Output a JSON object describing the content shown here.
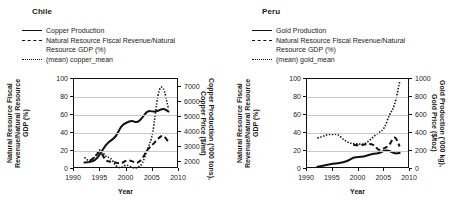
{
  "figure": {
    "panels": [
      {
        "id": "chile",
        "title": "Chile",
        "legend": [
          {
            "style": "solid",
            "label": "Copper Production"
          },
          {
            "style": "dashed",
            "label": "Natural Resource Fiscal Revenue/Natural\nResource GDP (%)"
          },
          {
            "style": "dotted",
            "label": "(mean) copper_mean"
          }
        ],
        "ylabel_left": "Natural Resource Fiscal\nRevenue/Natural Resource\nGDP (%)",
        "ylabel_right": "Copper Production ('000 tons),\nCopper Price ($/mt)",
        "xlabel": "Year",
        "yticks_left": [
          "0",
          "20",
          "40",
          "60",
          "80",
          "100"
        ],
        "yticks_right": [
          "2000",
          "3000",
          "4000",
          "5000",
          "6000",
          "7000"
        ],
        "xticks": [
          "1990",
          "1995",
          "2000",
          "2005",
          "2010"
        ]
      },
      {
        "id": "peru",
        "title": "Peru",
        "legend": [
          {
            "style": "solid",
            "label": "Gold Production"
          },
          {
            "style": "dashed",
            "label": "Natural Resource Fiscal Revenue/Natural\nResource GDP (%)"
          },
          {
            "style": "dotted",
            "label": "(mean) gold_mean"
          }
        ],
        "ylabel_left": "Natural Resource Fiscal\nRevenue/Natural Resource\nGDP (%)",
        "ylabel_right": "Gold Production ('000 kg),\nGold Price ($/toz)",
        "xlabel": "Year",
        "yticks_left": [
          "0",
          "20",
          "40",
          "60",
          "80",
          "100"
        ],
        "yticks_right": [
          "0",
          "200",
          "400",
          "600",
          "800",
          "1000"
        ],
        "xticks": [
          "1990",
          "1995",
          "2000",
          "2005",
          "2010"
        ]
      }
    ]
  },
  "chart_data": [
    {
      "type": "line",
      "id": "chile",
      "title": "Chile",
      "xlabel": "Year",
      "ylabel": "Natural Resource Fiscal Revenue/Natural Resource GDP (%)",
      "ylabel_secondary": "Copper Production ('000 tons), Copper Price ($/mt)",
      "xlim": [
        1990,
        2010
      ],
      "ylim": [
        0,
        100
      ],
      "ylim_secondary": [
        1500,
        7500
      ],
      "xticks": [
        1990,
        1995,
        2000,
        2005,
        2010
      ],
      "yticks": [
        0,
        20,
        40,
        60,
        80,
        100
      ],
      "yticks_secondary": [
        2000,
        3000,
        4000,
        5000,
        6000,
        7000
      ],
      "grid": "horizontal",
      "legend_position": "above-plot",
      "series": [
        {
          "name": "Copper Production",
          "style": "solid",
          "axis": "right",
          "units": "'000 tons",
          "x": [
            1992,
            1993,
            1994,
            1995,
            1996,
            1997,
            1998,
            1999,
            2000,
            2001,
            2002,
            2003,
            2004,
            2005,
            2006,
            2007,
            2008
          ],
          "values": [
            1930,
            1960,
            2060,
            2490,
            3100,
            3400,
            3650,
            4380,
            4600,
            4740,
            4580,
            4900,
            5400,
            5320,
            5360,
            5560,
            5330
          ]
        },
        {
          "name": "Natural Resource Fiscal Revenue/Natural Resource GDP (%)",
          "style": "dashed",
          "axis": "left",
          "units": "%",
          "x": [
            1993,
            1994,
            1995,
            1996,
            1997,
            1998,
            1999,
            2000,
            2001,
            2002,
            2003,
            2004,
            2005,
            2006,
            2007,
            2008
          ],
          "values": [
            9,
            13,
            21,
            9,
            8,
            7,
            6,
            10,
            9,
            6,
            11,
            22,
            27,
            34,
            38,
            30
          ]
        },
        {
          "name": "(mean) copper_mean",
          "style": "dotted",
          "axis": "right",
          "units": "$/mt",
          "x": [
            1992,
            1993,
            1994,
            1995,
            1996,
            1997,
            1998,
            1999,
            2000,
            2001,
            2002,
            2003,
            2004,
            2005,
            2006,
            2007,
            2008
          ],
          "values": [
            2280,
            1910,
            2310,
            2930,
            2290,
            2270,
            1650,
            1570,
            1810,
            1580,
            1560,
            1780,
            2870,
            3680,
            6720,
            7120,
            5490
          ]
        }
      ]
    },
    {
      "type": "line",
      "id": "peru",
      "title": "Peru",
      "xlabel": "Year",
      "ylabel": "Natural Resource Fiscal Revenue/Natural Resource GDP (%)",
      "ylabel_secondary": "Gold Production ('000 kg), Gold Price ($/toz)",
      "xlim": [
        1990,
        2010
      ],
      "ylim": [
        0,
        100
      ],
      "ylim_secondary": [
        0,
        1000
      ],
      "xticks": [
        1990,
        1995,
        2000,
        2005,
        2010
      ],
      "yticks": [
        0,
        20,
        40,
        60,
        80,
        100
      ],
      "yticks_secondary": [
        0,
        200,
        400,
        600,
        800,
        1000
      ],
      "grid": "horizontal",
      "legend_position": "above-plot",
      "series": [
        {
          "name": "Gold Production",
          "style": "solid",
          "axis": "right",
          "units": "'000 kg",
          "x": [
            1992,
            1993,
            1994,
            1995,
            1996,
            1997,
            1998,
            1999,
            2000,
            2001,
            2002,
            2003,
            2004,
            2005,
            2006,
            2007,
            2008
          ],
          "values": [
            25,
            35,
            48,
            57,
            64,
            74,
            93,
            128,
            133,
            138,
            157,
            172,
            173,
            208,
            203,
            170,
            179
          ]
        },
        {
          "name": "Natural Resource Fiscal Revenue/Natural Resource GDP (%)",
          "style": "dashed",
          "axis": "left",
          "units": "%",
          "x": [
            1999,
            2000,
            2001,
            2002,
            2003,
            2004,
            2005,
            2006,
            2007,
            2008
          ],
          "values": [
            27,
            26,
            27,
            28,
            27,
            20,
            23,
            26,
            38,
            25
          ]
        },
        {
          "name": "(mean) gold_mean",
          "style": "dotted",
          "axis": "right",
          "units": "$/toz",
          "x": [
            1992,
            1993,
            1994,
            1995,
            1996,
            1997,
            1998,
            1999,
            2000,
            2001,
            2002,
            2003,
            2004,
            2005,
            2006,
            2007,
            2008
          ],
          "values": [
            344,
            360,
            384,
            384,
            388,
            331,
            294,
            279,
            279,
            271,
            310,
            363,
            409,
            445,
            604,
            695,
            972
          ]
        }
      ]
    }
  ]
}
